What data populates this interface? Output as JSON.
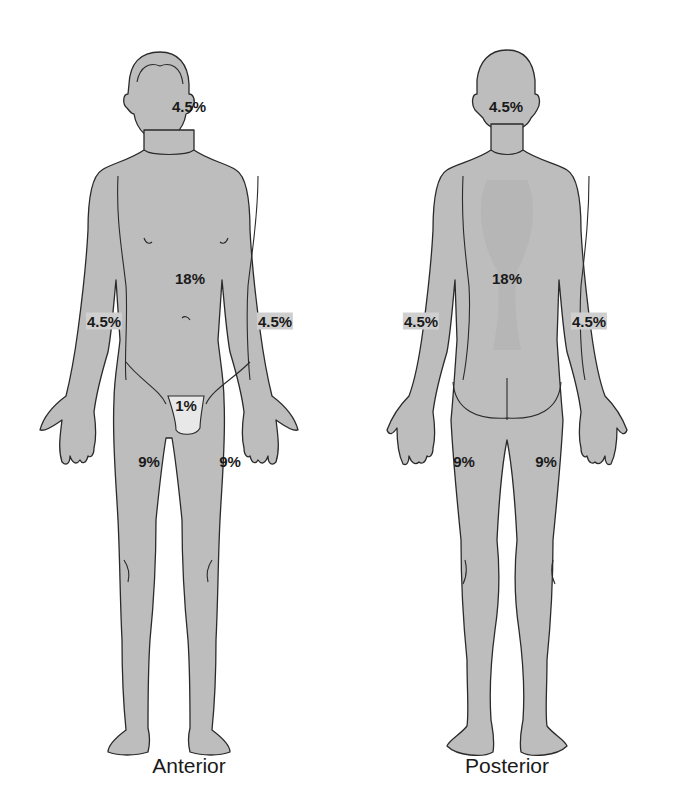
{
  "colors": {
    "body": "#bdbdbd",
    "groin": "#e8e8e8",
    "outline": "#2a2a2a",
    "background": "#ffffff",
    "text": "#1a1a1a"
  },
  "anterior": {
    "caption": "Anterior",
    "labels": {
      "head": "4.5%",
      "trunk": "18%",
      "right_arm": "4.5%",
      "left_arm": "4.5%",
      "genitalia": "1%",
      "right_leg": "9%",
      "left_leg": "9%"
    }
  },
  "posterior": {
    "caption": "Posterior",
    "labels": {
      "head": "4.5%",
      "trunk": "18%",
      "left_arm": "4.5%",
      "right_arm": "4.5%",
      "left_leg": "9%",
      "right_leg": "9%"
    }
  }
}
